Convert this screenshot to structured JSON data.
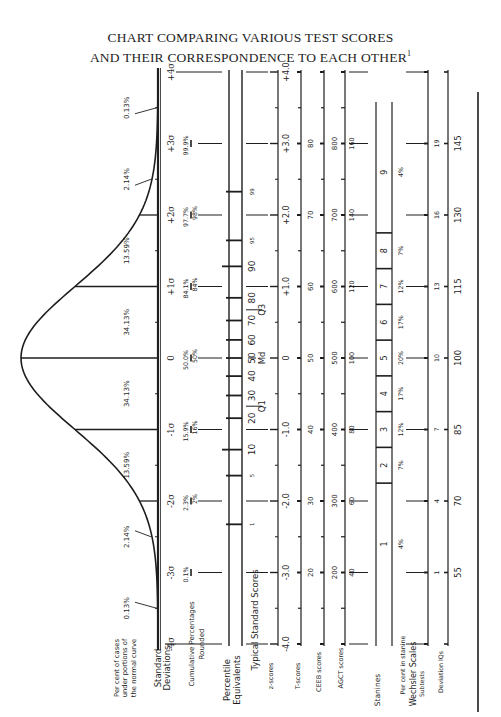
{
  "title": {
    "line1": "CHART COMPARING VARIOUS TEST SCORES",
    "line2": "AND THEIR CORRESPONDENCE TO EACH OTHER",
    "footnote_mark": "1"
  },
  "chart_data": {
    "type": "area",
    "orientation": "rotated 90° (σ axis runs vertically, -4σ at bottom, +4σ at top)",
    "curve": "normal distribution",
    "sigma_positions": [
      -4,
      -3,
      -2,
      -1,
      0,
      1,
      2,
      3,
      4
    ],
    "rows": {
      "percent_under_curve": {
        "label": "Per cent of cases under portions of the normal curve",
        "segments": [
          {
            "from": -4,
            "to": -3,
            "value": "0.13%"
          },
          {
            "from": -3,
            "to": -2,
            "value": "2.14%"
          },
          {
            "from": -2,
            "to": -1,
            "value": "13.59%"
          },
          {
            "from": -1,
            "to": 0,
            "value": "34.13%"
          },
          {
            "from": 0,
            "to": 1,
            "value": "34.13%"
          },
          {
            "from": 1,
            "to": 2,
            "value": "13.59%"
          },
          {
            "from": 2,
            "to": 3,
            "value": "2.14%"
          },
          {
            "from": 3,
            "to": 4,
            "value": "0.13%"
          }
        ]
      },
      "standard_deviations": {
        "label": "Standard Deviations",
        "ticks": [
          "-4σ",
          "-3σ",
          "-2σ",
          "-1σ",
          "0",
          "+1σ",
          "+2σ",
          "+3σ",
          "+4σ"
        ]
      },
      "cumulative_percentages": {
        "label": "Cumulative Percentages",
        "values": {
          "-3": "0.1%",
          "-2": "2.3%",
          "-1": "15.9%",
          "0": "50.0%",
          "1": "84.1%",
          "2": "97.7%",
          "3": "99.9%"
        }
      },
      "cumulative_rounded": {
        "label": "Rounded",
        "values": {
          "-2": "2%",
          "-1": "16%",
          "0": "50%",
          "1": "84%",
          "2": "98%"
        }
      },
      "percentile_equivalents": {
        "label": "Percentile Equivalents",
        "percentiles": [
          1,
          5,
          10,
          20,
          30,
          40,
          50,
          60,
          70,
          80,
          90,
          95,
          99
        ],
        "quartile_labels": {
          "Q1": 25,
          "Md": 50,
          "Q3": 75
        }
      },
      "z_scores": {
        "label": "z-scores",
        "group_label": "Typical Standard Scores",
        "values": [
          "-4.0",
          "-3.0",
          "-2.0",
          "-1.0",
          "0",
          "+1.0",
          "+2.0",
          "+3.0",
          "+4.0"
        ]
      },
      "t_scores": {
        "label": "T-scores",
        "values": [
          20,
          30,
          40,
          50,
          60,
          70,
          80
        ]
      },
      "ceeb_scores": {
        "label": "CEEB scores",
        "values": [
          200,
          300,
          400,
          500,
          600,
          700,
          800
        ]
      },
      "agct_scores": {
        "label": "AGCT scores",
        "values": [
          40,
          60,
          80,
          100,
          120,
          140,
          160
        ]
      },
      "stanines": {
        "label": "Stanines",
        "values": [
          1,
          2,
          3,
          4,
          5,
          6,
          7,
          8,
          9
        ],
        "per_cent_label": "Per cent in stanine",
        "per_cent": [
          "4%",
          "7%",
          "12%",
          "17%",
          "20%",
          "17%",
          "12%",
          "7%",
          "4%"
        ]
      },
      "wechsler_subtests": {
        "group_label": "Wechsler Scales",
        "label": "Subtests",
        "values": [
          1,
          4,
          7,
          10,
          13,
          16,
          19
        ]
      },
      "deviation_iq": {
        "label": "Deviation IQs",
        "values": [
          55,
          70,
          85,
          100,
          115,
          130,
          145
        ]
      }
    }
  },
  "labels": {
    "pct_curve": [
      "Per cent of cases",
      "under portions of",
      "the normal curve"
    ],
    "std_dev": [
      "Standard",
      "Deviations"
    ],
    "cum_pct": "Cumulative Percentages",
    "rounded": "Rounded",
    "percentile": [
      "Percentile",
      "Equivalents"
    ],
    "typical": "Typical Standard Scores",
    "z": "z-scores",
    "t": "T-scores",
    "ceeb": "CEEB scores",
    "agct": "AGCT scores",
    "stanines": "Stanines",
    "per_cent_stanine": "Per cent in stanine",
    "wechsler": "Wechsler Scales",
    "subtests": "Subtests",
    "dev_iq": "Deviation IQs",
    "q1": "Q",
    "q1_sub": "1",
    "md": "Md",
    "q3": "Q",
    "q3_sub": "3"
  }
}
